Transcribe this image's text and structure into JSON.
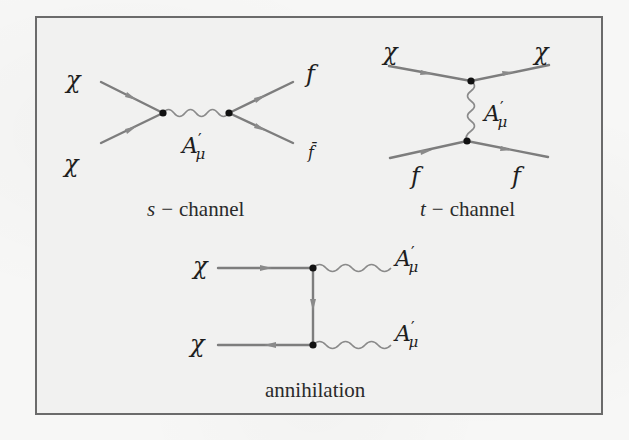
{
  "figure": {
    "type": "feynman-diagrams",
    "colors": {
      "fermion_line": "#7d7d7d",
      "boson_line": "#8a8a8a",
      "vertex": "#111111",
      "border": "#6b6b6b",
      "panel_bg": "#f1f1f0"
    },
    "s_channel": {
      "caption_var": "s",
      "caption_dash": "−",
      "caption_word": "channel",
      "in_top": "χ",
      "in_bottom": "χ",
      "out_top": "f",
      "out_bottom": "f̄",
      "mediator": "A",
      "mediator_prime": "′",
      "mediator_sub": "μ"
    },
    "t_channel": {
      "caption_var": "t",
      "caption_dash": "−",
      "caption_word": "channel",
      "top_left": "χ",
      "top_right": "χ",
      "bottom_left": "f",
      "bottom_right": "f",
      "mediator": "A",
      "mediator_prime": "′",
      "mediator_sub": "μ"
    },
    "annihilation": {
      "caption": "annihilation",
      "in_top": "χ",
      "in_bottom": "χ",
      "out_top": "A",
      "out_top_prime": "′",
      "out_top_sub": "μ",
      "out_bottom": "A",
      "out_bottom_prime": "′",
      "out_bottom_sub": "μ"
    }
  }
}
